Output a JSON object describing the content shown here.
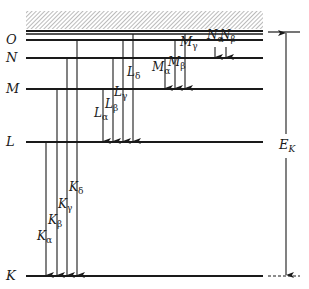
{
  "diagram": {
    "colors": {
      "line": "#1a1a1a",
      "hatch": "#9a9a9a",
      "background": "#ffffff"
    },
    "levels": [
      {
        "name": "O",
        "label": "O",
        "y": 40
      },
      {
        "name": "N",
        "label": "N",
        "y": 58
      },
      {
        "name": "M",
        "label": "M",
        "y": 89
      },
      {
        "name": "L",
        "label": "L",
        "y": 142
      },
      {
        "name": "K",
        "label": "K",
        "y": 276
      }
    ],
    "continuum": {
      "x1": 26,
      "x2": 263,
      "y1": 11,
      "y2": 29
    },
    "top_lines": [
      {
        "y": 31
      },
      {
        "y": 34
      }
    ],
    "level_x_start": 26,
    "level_x_end": 263,
    "transitions": [
      {
        "series": "K",
        "label": "K",
        "sub": "α",
        "x": 46,
        "from_y": 142,
        "to_y": 276,
        "label_x": 37,
        "label_y": 236
      },
      {
        "series": "K",
        "label": "K",
        "sub": "β",
        "x": 57,
        "from_y": 89,
        "to_y": 276,
        "label_x": 48,
        "label_y": 220
      },
      {
        "series": "K",
        "label": "K",
        "sub": "γ",
        "x": 67,
        "from_y": 58,
        "to_y": 276,
        "label_x": 58,
        "label_y": 204
      },
      {
        "series": "K",
        "label": "K",
        "sub": "δ",
        "x": 77,
        "from_y": 40,
        "to_y": 276,
        "label_x": 69,
        "label_y": 187
      },
      {
        "series": "L",
        "label": "L",
        "sub": "α",
        "x": 103,
        "from_y": 89,
        "to_y": 142,
        "label_x": 94,
        "label_y": 113
      },
      {
        "series": "L",
        "label": "L",
        "sub": "β",
        "x": 113,
        "from_y": 58,
        "to_y": 142,
        "label_x": 105,
        "label_y": 104
      },
      {
        "series": "L",
        "label": "L",
        "sub": "γ",
        "x": 123,
        "from_y": 40,
        "to_y": 142,
        "label_x": 114,
        "label_y": 92
      },
      {
        "series": "L",
        "label": "L",
        "sub": "δ",
        "x": 133,
        "from_y": 34,
        "to_y": 142,
        "label_x": 127,
        "label_y": 72
      },
      {
        "series": "M",
        "label": "M",
        "sub": "α",
        "x": 165,
        "from_y": 58,
        "to_y": 89,
        "label_x": 152,
        "label_y": 67
      },
      {
        "series": "M",
        "label": "M",
        "sub": "β",
        "x": 175,
        "from_y": 40,
        "to_y": 89,
        "label_x": 168,
        "label_y": 62
      },
      {
        "series": "M",
        "label": "M",
        "sub": "γ",
        "x": 185,
        "from_y": 34,
        "to_y": 89,
        "label_x": 180,
        "label_y": 42
      },
      {
        "series": "N",
        "label": "N",
        "sub": "α",
        "x": 215,
        "from_y": 47,
        "to_y": 58,
        "label_x": 207,
        "label_y": 35
      },
      {
        "series": "N",
        "label": "N",
        "sub": "β",
        "x": 226,
        "from_y": 47,
        "to_y": 58,
        "label_x": 220,
        "label_y": 35
      }
    ],
    "energy_arrow": {
      "label": "E",
      "sub": "K",
      "x": 286,
      "top_y": 32,
      "bottom_y": 276,
      "tick_x1": 268,
      "tick_x2": 300,
      "label_x": 279,
      "label_y": 146
    }
  }
}
